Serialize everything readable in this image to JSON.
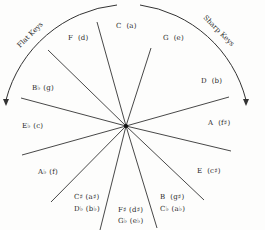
{
  "diagram": {
    "arc_labels": {
      "left": "Flat Keys",
      "right": "Sharp Keys"
    },
    "keys": [
      {
        "major": "C",
        "minor": "(a)"
      },
      {
        "major": "G",
        "minor": "(e)"
      },
      {
        "major": "D",
        "minor": "(b)"
      },
      {
        "major": "A",
        "minor": "(f♯)"
      },
      {
        "major": "E",
        "minor": "(c♯)"
      },
      {
        "major": "B",
        "minor": "(g♯)",
        "enharmonic_major": "C♭",
        "enharmonic_minor": "(a♭)"
      },
      {
        "major": "F♯",
        "minor": "(d♯)",
        "enharmonic_major": "G♭",
        "enharmonic_minor": "(e♭)"
      },
      {
        "major": "C♯",
        "minor": "(a♯)",
        "enharmonic_major": "D♭",
        "enharmonic_minor": "(b♭)"
      },
      {
        "major": "A♭",
        "minor": "(f)"
      },
      {
        "major": "E♭",
        "minor": "(c)"
      },
      {
        "major": "B♭",
        "minor": "(g)"
      },
      {
        "major": "F",
        "minor": "(d)"
      }
    ],
    "colors": {
      "line": "#333333",
      "text": "#2a2a2a",
      "background": "#fdfdfc"
    }
  }
}
